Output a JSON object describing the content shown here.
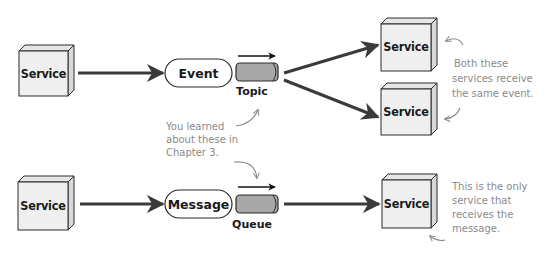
{
  "diagram": {
    "top_row": {
      "producer": {
        "label": "Service"
      },
      "event": {
        "label": "Event"
      },
      "topic": {
        "label": "Topic"
      },
      "consumers": [
        {
          "label": "Service"
        },
        {
          "label": "Service"
        }
      ],
      "note": {
        "lines": [
          "Both these",
          "services receive",
          "the same event."
        ]
      }
    },
    "middle_note": {
      "lines": [
        "You learned",
        "about these in",
        "Chapter 3."
      ]
    },
    "bottom_row": {
      "producer": {
        "label": "Service"
      },
      "message": {
        "label": "Message"
      },
      "queue": {
        "label": "Queue"
      },
      "consumer": {
        "label": "Service"
      },
      "note": {
        "lines": [
          "This is the only",
          "service that",
          "receives the",
          "message."
        ]
      }
    }
  },
  "colors": {
    "box_face": "#efefef",
    "box_side": "#d9d9d9",
    "box_top": "#e6e6e6",
    "outline": "#2a2a2a",
    "arrow": "#3a3a3a",
    "cylinder": "#a8a8a8",
    "note_text": "#8a8a8a"
  }
}
